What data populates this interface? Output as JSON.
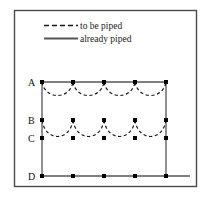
{
  "figure": {
    "frame": {
      "x": 14,
      "y": 10,
      "width": 183,
      "height": 177,
      "stroke_color": "#4a4a4a",
      "fill_color": "#ffffff"
    },
    "legend": {
      "entries": [
        {
          "key": "to-be-piped",
          "label": "to be piped",
          "line_style": "dashed",
          "color": "#1a1a1a"
        },
        {
          "key": "already-piped",
          "label": "already piped",
          "line_style": "solid",
          "color": "#555555"
        }
      ]
    },
    "rows": [
      {
        "key": "A",
        "label": "A",
        "y": 82,
        "label_x": 30,
        "point_count": 5
      },
      {
        "key": "B",
        "label": "B",
        "y": 120,
        "label_x": 30,
        "point_count": 5
      },
      {
        "key": "C",
        "label": "C",
        "y": 138,
        "label_x": 30,
        "point_count": 5
      },
      {
        "key": "D",
        "label": "D",
        "y": 176,
        "label_x": 30,
        "point_count": 5
      }
    ],
    "node_x_positions": [
      42,
      73,
      104,
      135,
      166
    ],
    "solid_segments": [
      {
        "key": "row-A-solid",
        "x1": 42,
        "y1": 82,
        "x2": 166,
        "y2": 82
      },
      {
        "key": "row-D-solid",
        "x1": 42,
        "y1": 176,
        "x2": 190,
        "y2": 176
      },
      {
        "key": "left-riser-solid",
        "x1": 42,
        "y1": 82,
        "x2": 42,
        "y2": 176
      },
      {
        "key": "right-riser-solid",
        "x1": 166,
        "y1": 82,
        "x2": 166,
        "y2": 176
      }
    ],
    "dashed_arcs": [
      {
        "key": "arc-A-1",
        "row": "A",
        "x1": 42,
        "x2": 73,
        "y": 82,
        "dip": 16
      },
      {
        "key": "arc-A-2",
        "row": "A",
        "x1": 73,
        "x2": 104,
        "y": 82,
        "dip": 16
      },
      {
        "key": "arc-A-3",
        "row": "A",
        "x1": 104,
        "x2": 135,
        "y": 82,
        "dip": 16
      },
      {
        "key": "arc-A-4",
        "row": "A",
        "x1": 135,
        "x2": 166,
        "y": 82,
        "dip": 16
      },
      {
        "key": "arc-B-1",
        "row": "B",
        "x1": 42,
        "x2": 73,
        "y": 120,
        "dip": 20
      },
      {
        "key": "arc-B-2",
        "row": "B",
        "x1": 73,
        "x2": 104,
        "y": 120,
        "dip": 20
      },
      {
        "key": "arc-B-3",
        "row": "B",
        "x1": 104,
        "x2": 135,
        "y": 120,
        "dip": 20
      },
      {
        "key": "arc-B-4",
        "row": "B",
        "x1": 135,
        "x2": 166,
        "y": 120,
        "dip": 20
      }
    ],
    "node_marker": {
      "shape": "square",
      "size": 4,
      "color": "#000000"
    },
    "colors": {
      "solid_line": "#555555",
      "dashed_line": "#1a1a1a",
      "frame": "#4a4a4a",
      "node": "#000000",
      "text": "#111111",
      "background": "#ffffff"
    }
  }
}
